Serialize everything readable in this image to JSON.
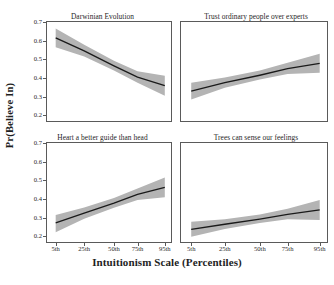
{
  "chart_data": {
    "type": "line",
    "title": "",
    "xlabel": "Intuitionism Scale (Percentiles)",
    "ylabel": "Pr(Believe In)",
    "grid": false,
    "legend": "none",
    "layout": "2x2 small multiples",
    "x": [
      5,
      25,
      50,
      75,
      95
    ],
    "xtick_labels": [
      "5th",
      "25th",
      "50th",
      "75th",
      "95th"
    ],
    "xtick_positions_frac": [
      0.07,
      0.3,
      0.54,
      0.73,
      0.95
    ],
    "ylim": [
      0.17,
      0.7
    ],
    "ytick_labels": [
      "0.7",
      "0.6",
      "0.5",
      "0.4",
      "0.3",
      "0.2"
    ],
    "ytick_values": [
      0.7,
      0.6,
      0.5,
      0.4,
      0.3,
      0.2
    ],
    "line_color": "#1a1a1a",
    "band_color": "#b4b4b4",
    "panels": [
      {
        "title": "Darwinian Evolution",
        "values": [
          0.615,
          0.545,
          0.465,
          0.405,
          0.36
        ],
        "ci_lower": [
          0.565,
          0.515,
          0.44,
          0.375,
          0.305
        ],
        "ci_upper": [
          0.665,
          0.578,
          0.492,
          0.437,
          0.412
        ]
      },
      {
        "title": "Trust ordinary people over experts",
        "values": [
          0.33,
          0.375,
          0.415,
          0.45,
          0.478
        ],
        "ci_lower": [
          0.285,
          0.348,
          0.392,
          0.422,
          0.428
        ],
        "ci_upper": [
          0.375,
          0.403,
          0.44,
          0.482,
          0.53
        ]
      },
      {
        "title": "Heart a better guide than head",
        "values": [
          0.272,
          0.325,
          0.378,
          0.425,
          0.462
        ],
        "ci_lower": [
          0.222,
          0.295,
          0.353,
          0.395,
          0.41
        ],
        "ci_upper": [
          0.315,
          0.355,
          0.405,
          0.457,
          0.515
        ]
      },
      {
        "title": "Trees can sense our feelings",
        "values": [
          0.238,
          0.265,
          0.293,
          0.318,
          0.342
        ],
        "ci_lower": [
          0.198,
          0.24,
          0.272,
          0.292,
          0.288
        ],
        "ci_upper": [
          0.278,
          0.292,
          0.317,
          0.348,
          0.395
        ]
      }
    ]
  }
}
